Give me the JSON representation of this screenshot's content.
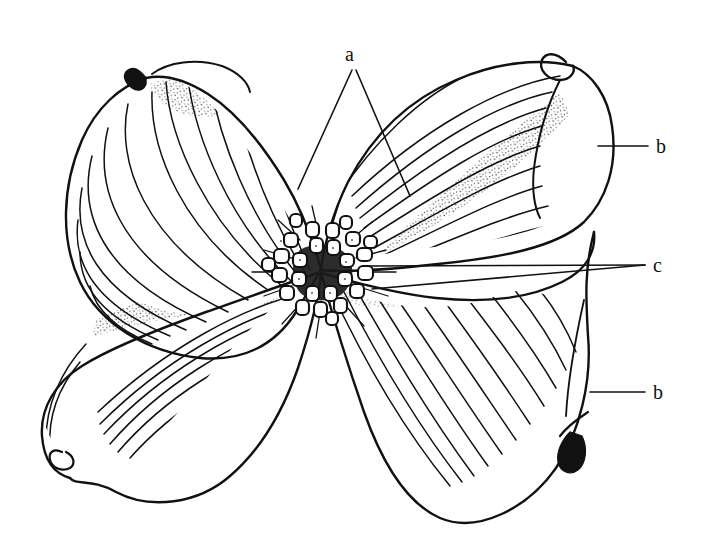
{
  "figure": {
    "background_color": "#ffffff",
    "ink_color": "#111111",
    "width": 702,
    "height": 538,
    "style": "pen-and-ink botanical line drawing with stipple shading",
    "parts": [
      {
        "key": "a",
        "name": "bract-notch-region",
        "count": 2
      },
      {
        "key": "b",
        "name": "bract",
        "count": 2
      },
      {
        "key": "c",
        "name": "flower-cluster",
        "count": 2
      }
    ]
  },
  "labels": {
    "a": "a",
    "b_top": "b",
    "b_bottom": "b",
    "c": "c"
  },
  "leaders": {
    "a": [
      {
        "from": [
          352,
          70
        ],
        "to": [
          298,
          189
        ]
      },
      {
        "from": [
          356,
          70
        ],
        "to": [
          410,
          196
        ]
      }
    ],
    "b_top": [
      {
        "from": [
          648,
          146
        ],
        "to": [
          598,
          146
        ]
      }
    ],
    "b_bottom": [
      {
        "from": [
          645,
          392
        ],
        "to": [
          590,
          392
        ]
      }
    ],
    "c": [
      {
        "from": [
          645,
          265
        ],
        "to": [
          368,
          266
        ]
      },
      {
        "from": [
          645,
          265
        ],
        "to": [
          372,
          289
        ]
      }
    ]
  },
  "center": {
    "name": "flower-cluster",
    "cx": 322,
    "cy": 272,
    "bud_count": 26,
    "description": "dense cluster of small rounded greenish-yellow florets drawn as outlined buds"
  },
  "bracts": [
    {
      "id": "upper-left",
      "label_key": "a",
      "vein_count": 14,
      "notch": {
        "x": 146,
        "y": 78,
        "dark_mark": true
      },
      "stipple": true
    },
    {
      "id": "upper-right",
      "label_key": "b_top",
      "vein_count": 13,
      "notch": {
        "x": 573,
        "y": 66,
        "dark_mark": false
      },
      "stipple": true
    },
    {
      "id": "lower-left",
      "label_key": "c",
      "vein_count": 15,
      "notch": {
        "x": 62,
        "y": 455,
        "dark_mark": false
      },
      "stipple": true
    },
    {
      "id": "lower-right",
      "label_key": "b_bottom",
      "vein_count": 14,
      "notch": {
        "x": 568,
        "y": 452,
        "dark_mark": true
      },
      "stipple": true
    }
  ]
}
